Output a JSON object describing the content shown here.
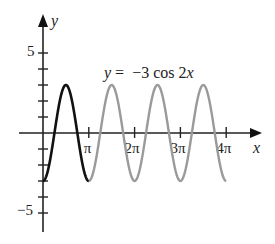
{
  "chart_data": {
    "type": "line",
    "title": "y = −3 cos 2x",
    "equation": {
      "prefix": "y",
      "equals": "=",
      "rhs_coef": "−3 cos 2",
      "rhs_var": "x"
    },
    "xlabel": "x",
    "ylabel": "y",
    "x_ticks": [
      {
        "value": 3.14159,
        "label": "π",
        "label_coef": ""
      },
      {
        "value": 6.28318,
        "label": "2π",
        "label_coef": "2"
      },
      {
        "value": 9.42478,
        "label": "3π",
        "label_coef": "3"
      },
      {
        "value": 12.56637,
        "label": "4π",
        "label_coef": "4"
      }
    ],
    "y_ticks": [
      -5,
      -4,
      -3,
      -2,
      -1,
      1,
      2,
      3,
      4,
      5
    ],
    "y_tick_labels": [
      {
        "value": 5,
        "label": "5"
      },
      {
        "value": -5,
        "label": "−5"
      }
    ],
    "xlim": [
      -0.5,
      13.4
    ],
    "ylim": [
      -6.2,
      7.2
    ],
    "grid": false,
    "series": [
      {
        "name": "one period (0 to π)",
        "color": "#111111",
        "x_range": [
          0,
          3.14159
        ],
        "function": "-3*cos(2x)",
        "amplitude": 3,
        "period": 3.14159
      },
      {
        "name": "continuation (π to 4π)",
        "color": "#9a9a9a",
        "x_range": [
          3.14159,
          12.56637
        ],
        "function": "-3*cos(2x)",
        "amplitude": 3,
        "period": 3.14159
      }
    ],
    "sample_points": [
      {
        "x": 0,
        "y": -3
      },
      {
        "x": 0.785,
        "y": 0
      },
      {
        "x": 1.571,
        "y": 3
      },
      {
        "x": 2.356,
        "y": 0
      },
      {
        "x": 3.142,
        "y": -3
      },
      {
        "x": 4.712,
        "y": 3
      },
      {
        "x": 6.283,
        "y": -3
      },
      {
        "x": 7.854,
        "y": 3
      },
      {
        "x": 9.425,
        "y": -3
      },
      {
        "x": 10.996,
        "y": 3
      },
      {
        "x": 12.566,
        "y": -3
      }
    ]
  },
  "labels": {
    "y_axis": "y",
    "x_axis": "x",
    "y_pos_five": "5",
    "y_neg_five": "−5",
    "pi_symbol": "π",
    "eq_y": "y",
    "eq_rest": " =  −3 cos 2",
    "eq_x": "x"
  },
  "colors": {
    "axis": "#222222",
    "primary_curve": "#111111",
    "secondary_curve": "#9a9a9a"
  }
}
